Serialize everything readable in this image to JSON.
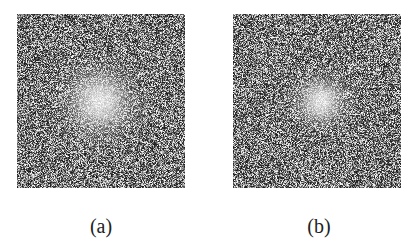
{
  "figure": {
    "background": "#ffffff",
    "panels": [
      {
        "id": "a",
        "label": "(a)",
        "description": "Speckle noise image with bright diffuse spot near center",
        "spot": {
          "cx": 0.49,
          "cy": 0.5,
          "radius": 0.11
        },
        "seed": 1337
      },
      {
        "id": "b",
        "label": "(b)",
        "description": "Speckle noise image with smaller bright spot near center",
        "spot": {
          "cx": 0.52,
          "cy": 0.5,
          "radius": 0.08
        },
        "seed": 4242
      }
    ]
  }
}
